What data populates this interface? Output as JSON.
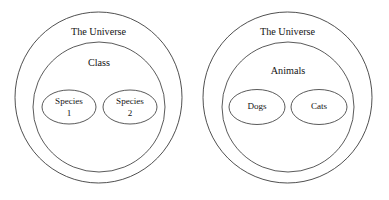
{
  "figure": {
    "background_color": "#ffffff",
    "stroke_color": "#3c3c3c",
    "text_color": "#141414",
    "width": 389,
    "height": 200
  },
  "diagrams": [
    {
      "name": "generic-taxonomy-diagram",
      "outer": {
        "label": "The Universe",
        "cx": 98.5,
        "cy": 97.5,
        "rx": 83.5,
        "ry": 85.5,
        "label_x": 98.5,
        "label_y": 33
      },
      "middle": {
        "label": "Class",
        "cx": 99,
        "cy": 107,
        "rx": 66,
        "ry": 65,
        "label_x": 99,
        "label_y": 64
      },
      "leaves": [
        {
          "label": "Species",
          "sublabel": "1",
          "cx": 69,
          "cy": 107,
          "rx": 27,
          "ry": 17,
          "label_x": 69,
          "label_y": 102,
          "sublabel_x": 69,
          "sublabel_y": 114
        },
        {
          "label": "Species",
          "sublabel": "2",
          "cx": 130,
          "cy": 107,
          "rx": 27,
          "ry": 17,
          "label_x": 130,
          "label_y": 102,
          "sublabel_x": 130,
          "sublabel_y": 114
        }
      ]
    },
    {
      "name": "animals-taxonomy-diagram",
      "outer": {
        "label": "The Universe",
        "cx": 287.5,
        "cy": 97.5,
        "rx": 84.5,
        "ry": 85.5,
        "label_x": 287.5,
        "label_y": 33
      },
      "middle": {
        "label": "Animals",
        "cx": 288,
        "cy": 107,
        "rx": 66,
        "ry": 65,
        "label_x": 288,
        "label_y": 72
      },
      "leaves": [
        {
          "label": "Dogs",
          "sublabel": "",
          "cx": 257,
          "cy": 107,
          "rx": 28,
          "ry": 17.5,
          "label_x": 257,
          "label_y": 107,
          "sublabel_x": 257,
          "sublabel_y": 107
        },
        {
          "label": "Cats",
          "sublabel": "",
          "cx": 319,
          "cy": 107,
          "rx": 28,
          "ry": 17.5,
          "label_x": 319,
          "label_y": 107,
          "sublabel_x": 319,
          "sublabel_y": 107
        }
      ]
    }
  ]
}
